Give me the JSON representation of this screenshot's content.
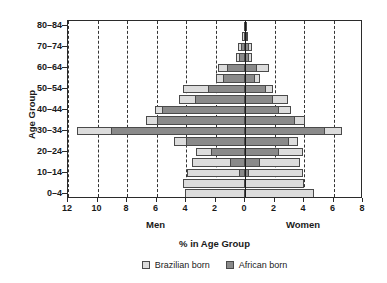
{
  "chart_data": {
    "type": "bar",
    "subtype": "population-pyramid",
    "title": "",
    "xlabel": "% in Age Group",
    "ylabel": "Age Group",
    "left_side_label": "Men",
    "right_side_label": "Women",
    "grid": true,
    "legend_position": "bottom",
    "axis": {
      "x_min_left": 12,
      "x_max_right": 8,
      "x_ticks_left": [
        12,
        10,
        8,
        6,
        4,
        2
      ],
      "x_tick_zero": 0,
      "x_ticks_right": [
        2,
        4,
        6,
        8
      ],
      "x_tick_labels": [
        "12",
        "10",
        "8",
        "6",
        "4",
        "2",
        "0",
        "2",
        "4",
        "6",
        "8"
      ],
      "x_tick_values": [
        -12,
        -10,
        -8,
        -6,
        -4,
        -2,
        0,
        2,
        4,
        6,
        8
      ]
    },
    "categories": [
      "0–4",
      "5–9",
      "10–14",
      "15–19",
      "20–24",
      "25–29",
      "30–34",
      "35–39",
      "40–44",
      "45–49",
      "50–54",
      "55–59",
      "60–64",
      "65–69",
      "70–74",
      "75–79",
      "80–84"
    ],
    "y_tick_labels": [
      "80–84",
      "70–74",
      "60–64",
      "50–54",
      "40–44",
      "30–34",
      "20–24",
      "10–14",
      "0–4"
    ],
    "series": [
      {
        "name": "Brazilian born",
        "color": "#dcdcdc",
        "men": [
          4.1,
          4.2,
          3.9,
          3.6,
          3.3,
          4.8,
          11.4,
          6.7,
          6.1,
          4.5,
          4.2,
          2.0,
          1.8,
          0.6,
          0.5,
          0.2,
          0.1
        ],
        "women": [
          4.7,
          4.0,
          3.9,
          3.7,
          3.9,
          3.6,
          6.6,
          4.1,
          3.1,
          2.9,
          1.9,
          1.0,
          1.6,
          0.5,
          0.5,
          0.2,
          0.1
        ]
      },
      {
        "name": "African born",
        "color": "#8a8a8a",
        "men": [
          0.0,
          0.0,
          0.4,
          1.0,
          2.3,
          4.0,
          9.1,
          6.0,
          5.6,
          3.4,
          2.5,
          1.5,
          1.2,
          0.4,
          0.3,
          0.1,
          0.1
        ],
        "women": [
          0.0,
          0.0,
          0.3,
          1.0,
          2.3,
          3.0,
          5.4,
          3.4,
          2.3,
          1.9,
          1.4,
          0.7,
          0.8,
          0.3,
          0.3,
          0.1,
          0.1
        ]
      }
    ]
  },
  "legend": {
    "items": [
      {
        "label": "Brazilian born",
        "color": "#dcdcdc"
      },
      {
        "label": "African born",
        "color": "#8a8a8a"
      }
    ]
  }
}
